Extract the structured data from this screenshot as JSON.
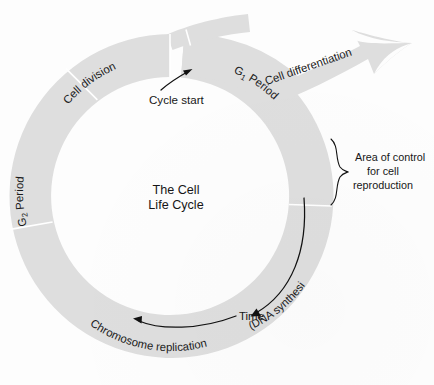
{
  "figure": {
    "center_title_line1": "The  Cell",
    "center_title_line2": "Life Cycle"
  },
  "ring_labels": {
    "cell_division": "Cell division",
    "g1_period_main": "G",
    "g1_period_sub": "1",
    "g1_period_rest": "  Period",
    "g2_period_main": "G",
    "g2_period_sub": "2",
    "g2_period_rest": "  Period",
    "chromosome_replication": "Chromosome replication",
    "dna_synthesis": "(DNA synthesis)"
  },
  "annotations": {
    "cycle_start": "Cycle start",
    "cell_differentiation": "Cell differentiation",
    "time": "Time",
    "area_of_control_line1": "Area of control",
    "area_of_control_line2": "for cell",
    "area_of_control_line3": "reproduction"
  },
  "colors": {
    "ring": "#dedede",
    "ring_divider": "#ffffff",
    "text": "#171717",
    "background": "#fdfdfd"
  }
}
